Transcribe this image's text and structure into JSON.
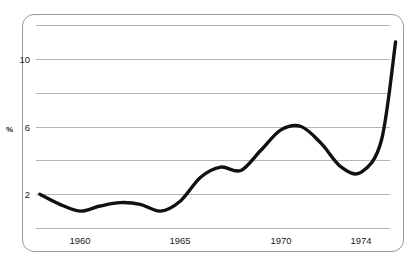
{
  "chart_data": {
    "type": "line",
    "title": "",
    "subtitle": "",
    "xlabel": "",
    "ylabel": "%",
    "xlim": [
      1958,
      1975.8
    ],
    "ylim": [
      0,
      12
    ],
    "grid": true,
    "legend": null,
    "y_axis": {
      "tick_labels": [
        "10",
        "6",
        "2"
      ],
      "tick_values": [
        10,
        6,
        2
      ],
      "gridline_values": [
        12,
        10,
        8,
        6,
        4,
        2,
        0
      ],
      "unit_label": "%"
    },
    "x_axis": {
      "tick_labels": [
        "1960",
        "1965",
        "1970",
        "1974"
      ],
      "tick_values": [
        1960,
        1965,
        1970,
        1974
      ]
    },
    "series": [
      {
        "name": "rate",
        "x": [
          1958.0,
          1959.0,
          1960.0,
          1961.0,
          1962.0,
          1963.0,
          1964.0,
          1965.0,
          1966.0,
          1967.0,
          1968.0,
          1969.0,
          1970.0,
          1971.0,
          1972.0,
          1973.0,
          1974.0,
          1975.0,
          1975.7
        ],
        "values": [
          2.0,
          1.4,
          1.0,
          1.3,
          1.5,
          1.4,
          1.0,
          1.6,
          3.0,
          3.6,
          3.4,
          4.6,
          5.8,
          6.0,
          5.0,
          3.6,
          3.3,
          5.2,
          11.0
        ]
      }
    ]
  },
  "labels": {
    "y_unit": "%",
    "y10": "10",
    "y6": "6",
    "y2": "2",
    "x1960": "1960",
    "x1965": "1965",
    "x1970": "1970",
    "x1974": "1974"
  },
  "colors": {
    "curve": "#111111",
    "gridline": "#b5b5b5",
    "frame": "#9a9a9a",
    "text": "#1a1a1a",
    "background": "#ffffff"
  }
}
